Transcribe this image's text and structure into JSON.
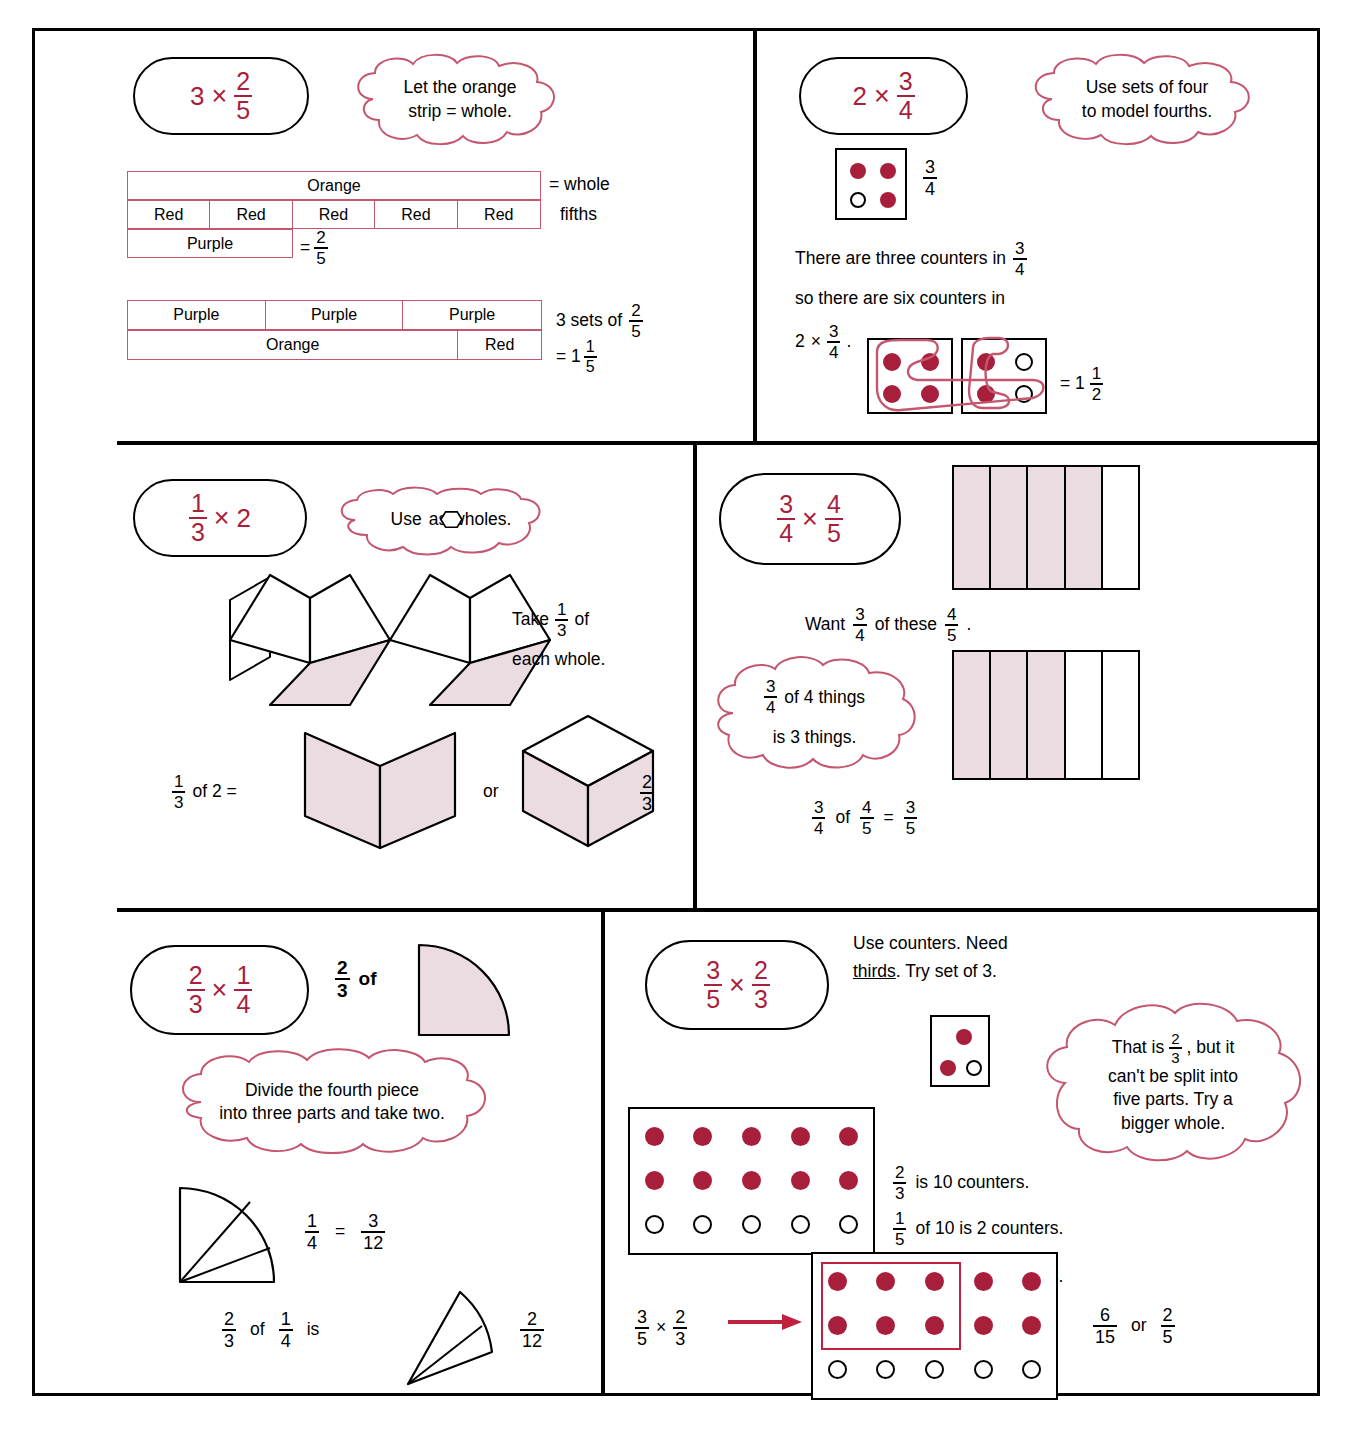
{
  "colors": {
    "red": "#A81F3C",
    "cloud_stroke": "#C4566F",
    "shade": "#EADCE0",
    "black": "#000000"
  },
  "panels": [
    {
      "id": "p1",
      "title": {
        "whole": "3",
        "op": "×",
        "frac_top": "2",
        "frac_bot": "5"
      },
      "cloud": "Let the orange\nstrip = whole.",
      "strip1": {
        "label": "Orange"
      },
      "strip2": {
        "labels": [
          "Red",
          "Red",
          "Red",
          "Red",
          "Red"
        ]
      },
      "strip3": {
        "label": "Purple"
      },
      "note_whole": "= whole",
      "note_fifths": "fifths",
      "eq_purple": {
        "prefix": "=",
        "top": "2",
        "bot": "5"
      },
      "strip4": {
        "labels": [
          "Purple",
          "Purple",
          "Purple"
        ]
      },
      "strip5": {
        "labels": [
          "Orange",
          "Red"
        ]
      },
      "sets_text": "3 sets of",
      "sets_frac": {
        "top": "2",
        "bot": "5"
      },
      "result": {
        "prefix": "= 1",
        "top": "1",
        "bot": "5"
      }
    },
    {
      "id": "p2",
      "title": {
        "whole": "2",
        "op": "×",
        "frac_top": "3",
        "frac_bot": "4"
      },
      "cloud": "Use sets of four\nto model fourths.",
      "box_label": {
        "top": "3",
        "bot": "4"
      },
      "box_counters": [
        "f",
        "f",
        "o",
        "f"
      ],
      "line1": {
        "pre": "There are three counters in",
        "top": "3",
        "bot": "4"
      },
      "line2": "so there are six counters in",
      "line3": {
        "whole": "2",
        "op": "×",
        "top": "3",
        "bot": "4",
        "suffix": "."
      },
      "boxA_counters": [
        "f",
        "f",
        "f",
        "f"
      ],
      "boxB_counters": [
        "f",
        "o",
        "f",
        "o"
      ],
      "result": {
        "prefix": "= 1",
        "top": "1",
        "bot": "2"
      }
    },
    {
      "id": "p3",
      "title": {
        "frac_top": "1",
        "frac_bot": "3",
        "op": "×",
        "whole": "2"
      },
      "cloud_pre": "Use",
      "cloud_post": "as wholes.",
      "take_line1_pre": "Take",
      "take_frac": {
        "top": "1",
        "bot": "3"
      },
      "take_line1_post": "of",
      "take_line2": "each whole.",
      "bottom_pre": {
        "top": "1",
        "bot": "3",
        "after": "of 2 ="
      },
      "or_label": "or",
      "bottom_frac": {
        "top": "2",
        "bot": "3"
      }
    },
    {
      "id": "p4",
      "title": {
        "frac1_top": "3",
        "frac1_bot": "4",
        "op": "×",
        "frac2_top": "4",
        "frac2_bot": "5"
      },
      "bar_top": {
        "cols": 5,
        "shaded": 4
      },
      "bar_bottom": {
        "cols": 5,
        "shaded": 3
      },
      "want_pre": "Want",
      "want_f1": {
        "top": "3",
        "bot": "4"
      },
      "want_mid": "of these",
      "want_f2": {
        "top": "4",
        "bot": "5"
      },
      "want_post": ".",
      "cloud_f": {
        "top": "3",
        "bot": "4"
      },
      "cloud_line1": "of 4 things",
      "cloud_line2": "is 3 things.",
      "eq": {
        "f1_top": "3",
        "f1_bot": "4",
        "of": "of",
        "f2_top": "4",
        "f2_bot": "5",
        "eq": "=",
        "f3_top": "3",
        "f3_bot": "5"
      }
    },
    {
      "id": "p5",
      "title": {
        "frac1_top": "2",
        "frac1_bot": "3",
        "op": "×",
        "frac2_top": "1",
        "frac2_bot": "4"
      },
      "of_frac": {
        "top": "2",
        "bot": "3"
      },
      "of_word": "of",
      "cloud": "Divide the fourth piece\ninto three parts and take two.",
      "eq1": {
        "f1_top": "1",
        "f1_bot": "4",
        "eq": "=",
        "f2_top": "3",
        "f2_bot": "12"
      },
      "eq2": {
        "f1_top": "2",
        "f1_bot": "3",
        "of": "of",
        "f2_top": "1",
        "f2_bot": "4",
        "is": "is",
        "f3_top": "2",
        "f3_bot": "12"
      }
    },
    {
      "id": "p6",
      "title": {
        "frac1_top": "3",
        "frac1_bot": "5",
        "op": "×",
        "frac2_top": "2",
        "frac2_bot": "3"
      },
      "header_line1": "Use counters.  Need",
      "header_underlined": "thirds",
      "header_line2_rest": ".  Try set of 3.",
      "small_box_counters": [
        "f",
        "f",
        "o"
      ],
      "cloud_pre": "That is",
      "cloud_frac": {
        "top": "2",
        "bot": "3"
      },
      "cloud_post": ", but it\ncan't be split into\nfive parts.  Try a\nbigger whole.",
      "grid1": {
        "cols": 5,
        "rows": 3,
        "filled_rows": 2
      },
      "fact1": {
        "top": "2",
        "bot": "3",
        "text": "is 10 counters."
      },
      "fact2": {
        "top": "1",
        "bot": "5",
        "text": "of 10 is 2 counters."
      },
      "fact3": {
        "top": "3",
        "bot": "5",
        "text": "of 10 is 6 counters."
      },
      "grid2": {
        "cols": 5,
        "rows": 3,
        "filled_rows": 2,
        "highlight_cols": 3,
        "highlight_rows": 2
      },
      "expr": {
        "f1_top": "3",
        "f1_bot": "5",
        "op": "×",
        "f2_top": "2",
        "f2_bot": "3"
      },
      "answer": {
        "f1_top": "6",
        "f1_bot": "15",
        "or": "or",
        "f2_top": "2",
        "f2_bot": "5"
      }
    }
  ]
}
